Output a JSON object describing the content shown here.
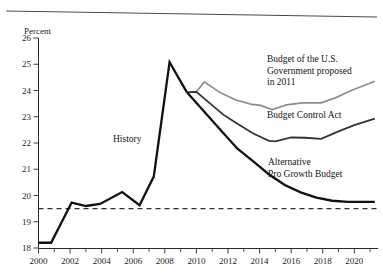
{
  "figure": {
    "background_color": "#ffffff",
    "top_rule": true
  },
  "chart_data": {
    "type": "line",
    "title": "",
    "subtitle": "",
    "xlabel": "",
    "ylabel": "Percent",
    "xlim": [
      2000,
      2021.5
    ],
    "ylim": [
      18,
      26
    ],
    "grid": false,
    "legend_position": "inline-annotations",
    "x_ticks_major": [
      2000,
      2002,
      2004,
      2006,
      2008,
      2010,
      2012,
      2014,
      2016,
      2018,
      2020
    ],
    "x_ticks_minor": [
      2001,
      2003,
      2005,
      2007,
      2009,
      2011,
      2013,
      2015,
      2017,
      2019,
      2021
    ],
    "y_ticks": [
      18,
      19,
      20,
      21,
      22,
      23,
      24,
      25,
      26
    ],
    "annotations": [
      {
        "name": "history-annotation",
        "text": "History",
        "lines": [
          "History"
        ],
        "x_px": 113,
        "y_px": 142
      },
      {
        "name": "budget-us-gov-annotation",
        "text": "Budget of the U.S. Government proposed in 2011",
        "lines": [
          "Budget of the U.S.",
          "Government proposed",
          "in 2011"
        ],
        "x_px": 267,
        "y_px": 62
      },
      {
        "name": "budget-control-act-annotation",
        "text": "Budget Control Act",
        "lines": [
          "Budget Control Act"
        ],
        "x_px": 267,
        "y_px": 118
      },
      {
        "name": "alternative-pro-growth-annotation",
        "text": "Alternative Pro Growth Budget",
        "lines": [
          "Alternative",
          "Pro Growth Budget"
        ],
        "x_px": 268,
        "y_px": 165
      }
    ],
    "reference_line": {
      "name": "historical-average",
      "value": 19.5,
      "style": "dashed",
      "color": "#303030"
    },
    "series": [
      {
        "name": "History",
        "color": "#111111",
        "width": 2.3,
        "x": [
          2000.0,
          2000.8,
          2002.1,
          2003.0,
          2003.9,
          2005.3,
          2006.4,
          2007.3,
          2008.3,
          2009.4
        ],
        "values": [
          18.2,
          18.2,
          19.73,
          19.6,
          19.68,
          20.13,
          19.63,
          20.72,
          25.08,
          23.93
        ]
      },
      {
        "name": "Budget of the U.S. Government proposed in 2011",
        "color": "#8d8d8d",
        "width": 1.7,
        "x": [
          2009.4,
          2010.0,
          2010.5,
          2011.5,
          2012.5,
          2013.5,
          2014.0,
          2014.8,
          2015.7,
          2016.7,
          2017.9,
          2018.8,
          2019.8,
          2021.3
        ],
        "values": [
          23.93,
          23.95,
          24.33,
          23.92,
          23.64,
          23.47,
          23.44,
          23.27,
          23.45,
          23.53,
          23.53,
          23.72,
          24.0,
          24.35
        ]
      },
      {
        "name": "Budget Control Act",
        "color": "#333333",
        "width": 1.8,
        "x": [
          2009.4,
          2010.0,
          2011.7,
          2012.6,
          2013.6,
          2014.6,
          2015.0,
          2016.0,
          2016.9,
          2017.9,
          2019.0,
          2020.0,
          2021.3
        ],
        "values": [
          23.93,
          23.95,
          23.08,
          22.73,
          22.36,
          22.08,
          22.06,
          22.21,
          22.2,
          22.16,
          22.44,
          22.68,
          22.93
        ]
      },
      {
        "name": "Alternative Pro Growth Budget",
        "color": "#111111",
        "width": 2.3,
        "x": [
          2009.4,
          2011.7,
          2012.6,
          2013.6,
          2014.6,
          2015.6,
          2016.6,
          2017.6,
          2018.6,
          2019.6,
          2021.3
        ],
        "values": [
          23.93,
          22.38,
          21.78,
          21.3,
          20.8,
          20.4,
          20.12,
          19.92,
          19.8,
          19.76,
          19.76
        ]
      }
    ]
  }
}
